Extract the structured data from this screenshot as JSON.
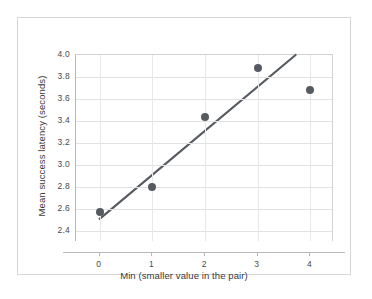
{
  "chart_data": {
    "type": "scatter",
    "title": "",
    "xlabel": "Min (smaller value in the pair)",
    "ylabel": "Mean success latency (seconds)",
    "x": [
      0,
      1,
      2,
      3,
      4
    ],
    "values": [
      2.57,
      2.8,
      3.44,
      3.88,
      3.68
    ],
    "series": [
      {
        "name": "Mean success latency",
        "x": [
          0,
          1,
          2,
          3,
          4
        ],
        "values": [
          2.57,
          2.8,
          3.44,
          3.88,
          3.68
        ]
      },
      {
        "name": "trend line",
        "type": "line",
        "x": [
          0,
          3.72
        ],
        "values": [
          2.51,
          4.0
        ]
      }
    ],
    "xlim": [
      -0.45,
      4.45
    ],
    "ylim": [
      2.3,
      4.0
    ],
    "xticks": [
      0,
      1,
      2,
      3,
      4
    ],
    "xtick_labels": [
      "0",
      "1",
      "2",
      "3",
      "4"
    ],
    "yticks": [
      2.4,
      2.6,
      2.8,
      3.0,
      3.2,
      3.4,
      3.6,
      3.8,
      4.0
    ],
    "ytick_labels": [
      "2.4",
      "2.6",
      "2.8",
      "3.0",
      "3.2",
      "3.4",
      "3.6",
      "3.8",
      "4.0"
    ],
    "grid": true,
    "legend": "none",
    "colors": {
      "marker": "#565b61",
      "trend_line": "#565b61",
      "gridline": "#e2e2e2",
      "axis": "#b9b9b9",
      "text": "#3a3a3a",
      "card_border": "#d6d6d6",
      "background": "#ffffff"
    }
  }
}
